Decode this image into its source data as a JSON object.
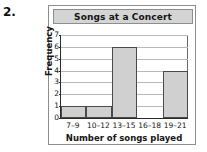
{
  "question_number": "2.",
  "card": {
    "title": "Songs at a Concert"
  },
  "chart_data": {
    "type": "bar",
    "title": "Songs at a Concert",
    "xlabel": "Number of songs played",
    "ylabel": "Frequency",
    "categories": [
      "7–9",
      "10–12",
      "13–15",
      "16–18",
      "19–21"
    ],
    "values": [
      1,
      1,
      6,
      0,
      4
    ],
    "ylim": [
      0,
      7
    ],
    "ytick_labels": [
      "0",
      "1",
      "2",
      "3",
      "4",
      "5",
      "6",
      "7"
    ],
    "grid": true,
    "legend": "none",
    "bar_fill_color": "#d0d0d0",
    "bar_border_color": "#4a4a4a",
    "title_band_color": "#d4d4d4"
  }
}
